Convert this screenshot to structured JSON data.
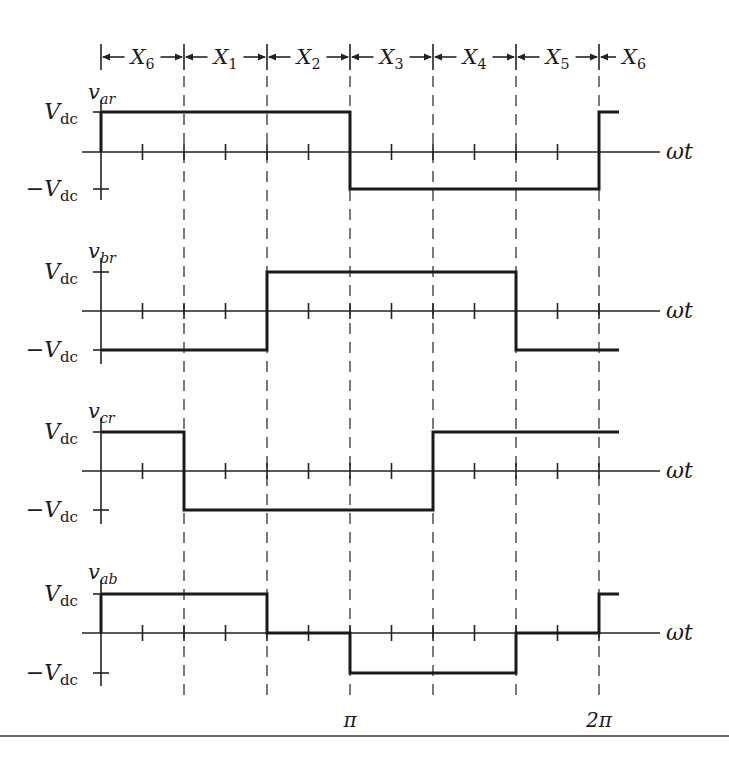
{
  "figure": {
    "interval_labels": [
      {
        "base": "X",
        "sub": "6"
      },
      {
        "base": "X",
        "sub": "1"
      },
      {
        "base": "X",
        "sub": "2"
      },
      {
        "base": "X",
        "sub": "3"
      },
      {
        "base": "X",
        "sub": "4"
      },
      {
        "base": "X",
        "sub": "5"
      },
      {
        "base": "X",
        "sub": "6"
      }
    ],
    "time_axis_label": "ωt",
    "x_tick_labels": [
      {
        "label": "π",
        "position": "pi"
      },
      {
        "label": "2π",
        "position": "2pi"
      }
    ],
    "level_labels": {
      "pos": {
        "base": "V",
        "sub": "dc"
      },
      "neg": {
        "prefix": "−",
        "base": "V",
        "sub": "dc"
      }
    },
    "plots": [
      {
        "name": "v_ar",
        "label": {
          "base": "v",
          "sub": "ar"
        },
        "levels_by_segment": [
          1,
          1,
          1,
          -1,
          -1,
          -1,
          1
        ]
      },
      {
        "name": "v_br",
        "label": {
          "base": "v",
          "sub": "br"
        },
        "levels_by_segment": [
          -1,
          -1,
          1,
          1,
          1,
          -1,
          -1
        ]
      },
      {
        "name": "v_cr",
        "label": {
          "base": "v",
          "sub": "cr"
        },
        "levels_by_segment": [
          1,
          -1,
          -1,
          -1,
          1,
          1,
          1
        ]
      },
      {
        "name": "v_ab",
        "label": {
          "base": "v",
          "sub": "ab"
        },
        "levels_by_segment": [
          1,
          1,
          0,
          -1,
          -1,
          0,
          1
        ]
      }
    ]
  }
}
